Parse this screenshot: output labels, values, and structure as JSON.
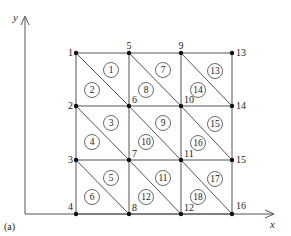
{
  "figure": {
    "panel_label": "(a)",
    "axes": {
      "x_label": "x",
      "y_label": "y"
    },
    "grid": {
      "columns_x": [
        76,
        129,
        181,
        232
      ],
      "rows_y": [
        53,
        106,
        160,
        214
      ]
    },
    "nodes": [
      {
        "id": "1",
        "col": 0,
        "row": 0
      },
      {
        "id": "2",
        "col": 0,
        "row": 1
      },
      {
        "id": "3",
        "col": 0,
        "row": 2
      },
      {
        "id": "4",
        "col": 0,
        "row": 3
      },
      {
        "id": "5",
        "col": 1,
        "row": 0
      },
      {
        "id": "6",
        "col": 1,
        "row": 1
      },
      {
        "id": "7",
        "col": 1,
        "row": 2
      },
      {
        "id": "8",
        "col": 1,
        "row": 3
      },
      {
        "id": "9",
        "col": 2,
        "row": 0
      },
      {
        "id": "10",
        "col": 2,
        "row": 1
      },
      {
        "id": "11",
        "col": 2,
        "row": 2
      },
      {
        "id": "12",
        "col": 2,
        "row": 3
      },
      {
        "id": "13",
        "col": 3,
        "row": 0
      },
      {
        "id": "14",
        "col": 3,
        "row": 1
      },
      {
        "id": "15",
        "col": 3,
        "row": 2
      },
      {
        "id": "16",
        "col": 3,
        "row": 3
      }
    ],
    "elements": [
      {
        "id": "1",
        "x": 111,
        "y": 70
      },
      {
        "id": "2",
        "x": 92,
        "y": 90
      },
      {
        "id": "3",
        "x": 111,
        "y": 123
      },
      {
        "id": "4",
        "x": 92,
        "y": 142
      },
      {
        "id": "5",
        "x": 111,
        "y": 178
      },
      {
        "id": "6",
        "x": 92,
        "y": 197
      },
      {
        "id": "7",
        "x": 163,
        "y": 70
      },
      {
        "id": "8",
        "x": 146,
        "y": 90
      },
      {
        "id": "9",
        "x": 163,
        "y": 123
      },
      {
        "id": "10",
        "x": 146,
        "y": 142
      },
      {
        "id": "11",
        "x": 163,
        "y": 178
      },
      {
        "id": "12",
        "x": 146,
        "y": 197
      },
      {
        "id": "13",
        "x": 215,
        "y": 71
      },
      {
        "id": "14",
        "x": 198,
        "y": 90
      },
      {
        "id": "15",
        "x": 215,
        "y": 124
      },
      {
        "id": "16",
        "x": 198,
        "y": 143
      },
      {
        "id": "17",
        "x": 215,
        "y": 179
      },
      {
        "id": "18",
        "x": 198,
        "y": 197
      }
    ]
  }
}
